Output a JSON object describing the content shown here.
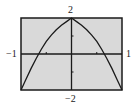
{
  "chart_data": {
    "type": "line",
    "title": "",
    "xlabel": "",
    "ylabel": "",
    "xlim": [
      -1,
      1
    ],
    "ylim": [
      -2,
      2
    ],
    "x_ticks": [
      -0.5,
      0.5
    ],
    "y_ticks": [
      -1,
      1
    ],
    "grid": false,
    "legend": null,
    "tick_labels": {
      "x_min": "−1",
      "x_max": "1",
      "y_max": "2",
      "y_min": "−2"
    },
    "series": [
      {
        "name": "curve",
        "x": [
          -1.0,
          -0.9,
          -0.8,
          -0.7,
          -0.6,
          -0.5,
          -0.4,
          -0.3,
          -0.2,
          -0.1,
          0.0,
          0.1,
          0.2,
          0.3,
          0.4,
          0.5,
          0.6,
          0.7,
          0.8,
          0.9,
          1.0
        ],
        "y": [
          -2.0,
          -1.4,
          -0.8,
          -0.25,
          0.25,
          0.7,
          1.05,
          1.35,
          1.6,
          1.8,
          2.0,
          1.8,
          1.6,
          1.35,
          1.05,
          0.7,
          0.25,
          -0.25,
          -0.8,
          -1.4,
          -2.0
        ]
      }
    ]
  },
  "colors": {
    "plot_background": "#d9d9d9",
    "axis_color": "#1a1a1a",
    "curve_color": "#1a1a1a"
  }
}
